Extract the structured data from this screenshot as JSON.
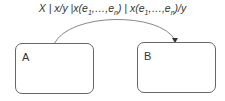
{
  "transition": {
    "label_parts": [
      "X | x/y |x(e",
      "1",
      ",…,e",
      "n",
      ") | x(e",
      "1",
      ",…,e",
      "n",
      ")/y"
    ],
    "from": "A",
    "to": "B",
    "color": "#888888"
  },
  "states": [
    {
      "name": "A"
    },
    {
      "name": "B"
    }
  ]
}
